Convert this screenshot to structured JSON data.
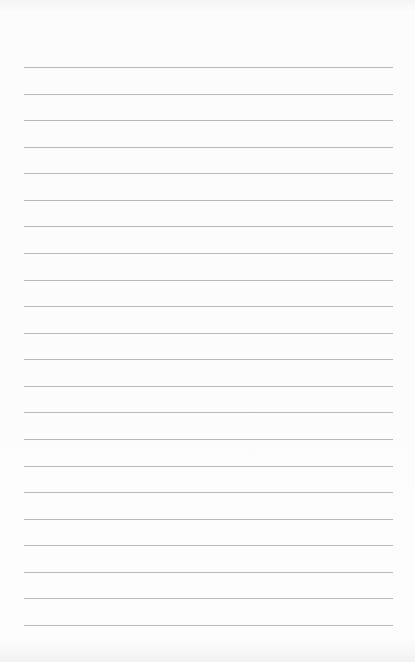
{
  "page": {
    "type": "lined-notepad",
    "line_count": 22,
    "first_line_y": 67,
    "line_spacing": 26.57,
    "line_left": 24,
    "line_width": 369,
    "line_color": "#b9b9b9",
    "paper_color": "#fcfcfc"
  }
}
